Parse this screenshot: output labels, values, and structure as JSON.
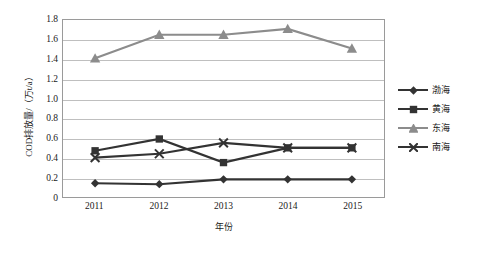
{
  "chart_data": {
    "type": "line",
    "title": "",
    "xlabel": "年份",
    "ylabel": "COD排放量/（万t/a）",
    "categories": [
      "2011",
      "2012",
      "2013",
      "2014",
      "2015"
    ],
    "ylim": [
      0,
      1.8
    ],
    "ytick_step": 0.2,
    "yticks": [
      "1.8",
      "1.6",
      "1.4",
      "1.2",
      "1.0",
      "0.8",
      "0.6",
      "0.4",
      "0.2",
      "0"
    ],
    "grid": true,
    "legend_position": "right",
    "series": [
      {
        "name": "渤海",
        "marker": "diamond",
        "color": "#333333",
        "values": [
          0.14,
          0.13,
          0.18,
          0.18,
          0.18
        ]
      },
      {
        "name": "黄海",
        "marker": "square",
        "color": "#333333",
        "values": [
          0.47,
          0.59,
          0.35,
          0.5,
          0.5
        ]
      },
      {
        "name": "东海",
        "marker": "triangle",
        "color": "#8c8c8c",
        "values": [
          1.41,
          1.65,
          1.65,
          1.71,
          1.51
        ]
      },
      {
        "name": "南海",
        "marker": "x",
        "color": "#333333",
        "values": [
          0.4,
          0.44,
          0.55,
          0.5,
          0.5
        ]
      }
    ]
  },
  "legend": {
    "items": [
      {
        "label": "渤海"
      },
      {
        "label": "黄海"
      },
      {
        "label": "东海"
      },
      {
        "label": "南海"
      }
    ]
  }
}
